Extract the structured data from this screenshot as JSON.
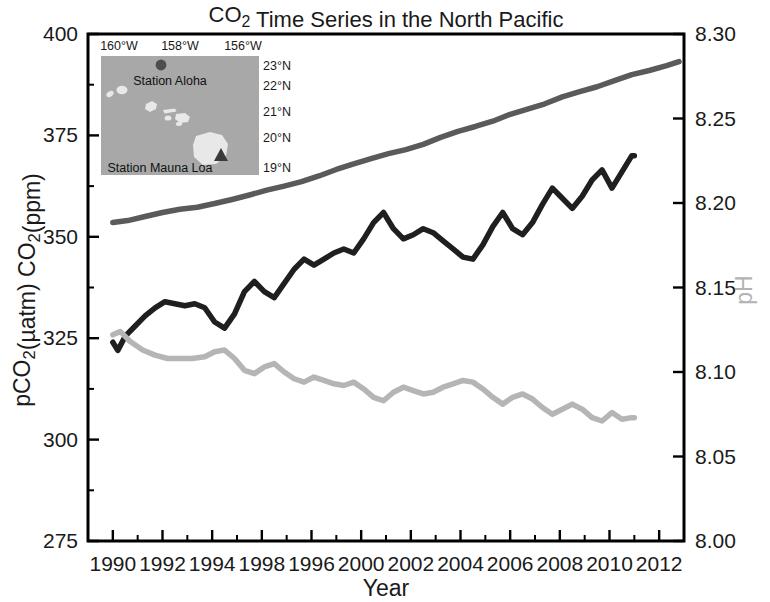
{
  "chart_data": {
    "type": "line",
    "xlabel": "Year",
    "ylabel_left": "pCO₂(µatm)  CO₂(ppm)",
    "ylabel_right": "pH",
    "xlim": [
      1989,
      2013
    ],
    "ylim_left": [
      275,
      400
    ],
    "ylim_right": [
      8.0,
      8.3
    ],
    "grid": false,
    "legend_position": "none",
    "x_tick_labels": [
      "1990",
      "1992",
      "1994",
      "1998",
      "1996",
      "2000",
      "2002",
      "2004",
      "2006",
      "2008",
      "2010",
      "2012"
    ],
    "x_tick_values": [
      1990,
      1992,
      1994,
      1996,
      1998,
      2000,
      2002,
      2004,
      2006,
      2008,
      2010,
      2012
    ],
    "y_left_tick_labels": [
      "400",
      "375",
      "350",
      "325",
      "300",
      "275"
    ],
    "y_left_tick_values": [
      400,
      375,
      350,
      325,
      300,
      275
    ],
    "y_right_tick_labels": [
      "8.30",
      "8.25",
      "8.20",
      "8.15",
      "8.10",
      "8.05",
      "8.00"
    ],
    "y_right_tick_values": [
      8.3,
      8.25,
      8.2,
      8.15,
      8.1,
      8.05,
      8.0
    ],
    "series": [
      {
        "name": "Atmospheric CO₂ (Mauna Loa)",
        "axis": "left",
        "color": "#5a5a5a",
        "width": 5.5,
        "x": [
          1990.0,
          1990.6,
          1991.3,
          1992.0,
          1992.7,
          1993.4,
          1994.1,
          1994.8,
          1995.5,
          1996.2,
          1996.9,
          1997.6,
          1998.3,
          1999.0,
          1999.7,
          2000.4,
          2001.1,
          2001.8,
          2002.5,
          2003.2,
          2003.9,
          2004.6,
          2005.3,
          2006.0,
          2006.7,
          2007.4,
          2008.1,
          2008.8,
          2009.5,
          2010.2,
          2010.9,
          2011.6,
          2012.3,
          2012.8
        ],
        "y": [
          353.5,
          354.0,
          355.0,
          356.0,
          356.8,
          357.3,
          358.2,
          359.2,
          360.3,
          361.5,
          362.5,
          363.6,
          365.0,
          366.6,
          368.0,
          369.3,
          370.5,
          371.5,
          372.8,
          374.5,
          376.0,
          377.2,
          378.5,
          380.2,
          381.5,
          382.8,
          384.5,
          385.8,
          387.0,
          388.5,
          390.0,
          391.0,
          392.2,
          393.2
        ]
      },
      {
        "name": "Seawater pCO₂ (Station ALOHA)",
        "axis": "left",
        "color": "#1f1f1f",
        "width": 5.5,
        "x": [
          1990.0,
          1990.2,
          1990.5,
          1990.9,
          1991.3,
          1991.7,
          1992.1,
          1992.5,
          1992.9,
          1993.3,
          1993.7,
          1994.1,
          1994.5,
          1994.9,
          1995.3,
          1995.7,
          1996.1,
          1996.5,
          1996.9,
          1997.3,
          1997.7,
          1998.1,
          1998.5,
          1998.9,
          1999.3,
          1999.7,
          2000.1,
          2000.5,
          2000.9,
          2001.3,
          2001.7,
          2002.1,
          2002.5,
          2002.9,
          2003.3,
          2003.7,
          2004.1,
          2004.5,
          2004.9,
          2005.3,
          2005.7,
          2006.1,
          2006.5,
          2006.9,
          2007.3,
          2007.7,
          2008.1,
          2008.5,
          2008.9,
          2009.3,
          2009.7,
          2010.1,
          2010.5,
          2010.9,
          2011.0
        ],
        "y": [
          324.0,
          322.0,
          325.5,
          328.0,
          330.5,
          332.5,
          334.0,
          333.5,
          333.0,
          333.5,
          332.5,
          329.0,
          327.5,
          331.0,
          336.5,
          339.0,
          336.5,
          335.0,
          338.5,
          342.0,
          344.5,
          343.0,
          344.5,
          346.0,
          347.0,
          346.0,
          349.5,
          353.5,
          356.0,
          352.0,
          349.5,
          350.5,
          352.0,
          351.0,
          349.0,
          347.0,
          345.0,
          344.5,
          348.0,
          352.5,
          356.0,
          352.0,
          350.5,
          353.5,
          358.0,
          362.0,
          359.5,
          357.0,
          360.0,
          364.0,
          366.5,
          362.0,
          366.0,
          370.0,
          370.0
        ]
      },
      {
        "name": "Seawater pH (Station ALOHA)",
        "axis": "right",
        "color": "#b5b5b5",
        "width": 5.5,
        "x": [
          1990.0,
          1990.3,
          1990.7,
          1991.2,
          1991.7,
          1992.2,
          1992.7,
          1993.2,
          1993.7,
          1994.1,
          1994.5,
          1994.9,
          1995.3,
          1995.7,
          1996.1,
          1996.5,
          1996.9,
          1997.3,
          1997.7,
          1998.1,
          1998.5,
          1998.9,
          1999.3,
          1999.7,
          2000.1,
          2000.5,
          2000.9,
          2001.3,
          2001.7,
          2002.1,
          2002.5,
          2002.9,
          2003.3,
          2003.7,
          2004.1,
          2004.5,
          2004.9,
          2005.3,
          2005.7,
          2006.1,
          2006.5,
          2006.9,
          2007.3,
          2007.7,
          2008.1,
          2008.5,
          2008.9,
          2009.3,
          2009.7,
          2010.1,
          2010.5,
          2010.9,
          2011.0
        ],
        "y": [
          8.122,
          8.124,
          8.118,
          8.113,
          8.11,
          8.108,
          8.108,
          8.108,
          8.109,
          8.112,
          8.113,
          8.108,
          8.101,
          8.099,
          8.103,
          8.105,
          8.1,
          8.096,
          8.094,
          8.097,
          8.095,
          8.093,
          8.092,
          8.094,
          8.09,
          8.085,
          8.083,
          8.088,
          8.091,
          8.089,
          8.087,
          8.088,
          8.091,
          8.093,
          8.095,
          8.094,
          8.09,
          8.085,
          8.081,
          8.085,
          8.087,
          8.084,
          8.079,
          8.075,
          8.078,
          8.081,
          8.078,
          8.073,
          8.071,
          8.076,
          8.072,
          8.073,
          8.073
        ]
      }
    ]
  },
  "inset_map": {
    "name": "hawaii-locator-map",
    "lon_labels": [
      "160°W",
      "158°W",
      "156°W"
    ],
    "lat_labels": [
      "23°N",
      "22°N",
      "21°N",
      "20°N",
      "19°N"
    ],
    "stations": [
      {
        "label": "Station Aloha",
        "marker": "circle"
      },
      {
        "label": "Station Mauna Loa",
        "marker": "triangle"
      }
    ],
    "ocean_color": "#a8a8a8",
    "land_color": "#e8e8e8"
  }
}
